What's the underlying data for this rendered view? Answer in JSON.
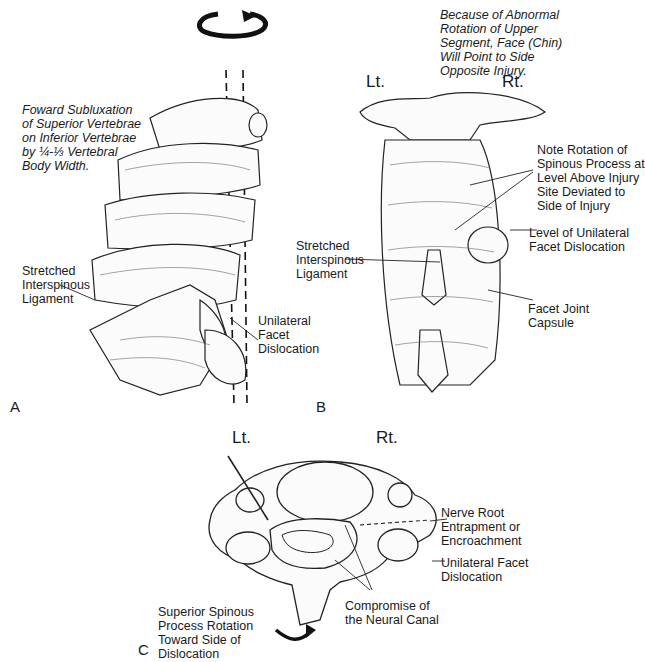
{
  "figure": {
    "rotation_symbol": "counterclockwise-rotation-arrow",
    "top_note": "Because of Abnormal\nRotation of Upper\nSegment, Face (Chin)\nWill Point to Side\nOpposite Injury.",
    "panels": {
      "A": {
        "letter": "A",
        "view": "lateral",
        "labels": {
          "subluxation": "Foward Subluxation\nof Superior Vertebrae\non Inferior Vertebrae\nby ¼-⅓ Vertebral\nBody Width.",
          "ligament": "Stretched\nInterspinous\nLigament",
          "dislocation": "Unilateral\nFacet\nDislocation"
        }
      },
      "B": {
        "letter": "B",
        "view": "posterior",
        "left": "Lt.",
        "right": "Rt.",
        "labels": {
          "rotation_note": "Note Rotation of\nSpinous Process at\nLevel Above Injury\nSite Deviated to\nSide of Injury",
          "level": "Level of Unilateral\nFacet Dislocation",
          "ligament": "Stretched\nInterspinous\nLigament",
          "capsule": "Facet Joint\nCapsule"
        }
      },
      "C": {
        "letter": "C",
        "view": "axial",
        "left": "Lt.",
        "right": "Rt.",
        "labels": {
          "nerve": "Nerve Root\nEntrapment or\nEncroachment",
          "dislocation": "Unilateral Facet\nDislocation",
          "canal": "Compromise of\nthe Neural Canal",
          "spinous": "Superior Spinous\nProcess Rotation\nToward Side of\nDislocation"
        }
      }
    }
  }
}
